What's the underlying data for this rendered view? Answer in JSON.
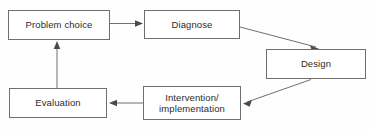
{
  "diagram": {
    "type": "cycle-flowchart",
    "background_color": "#fefefe",
    "line_color": "#6f6f6f",
    "text_color": "#2b2b2b",
    "nodes": [
      {
        "id": "problem-choice",
        "label": "Problem choice",
        "x": 8,
        "y": 10,
        "width": 102,
        "height": 30
      },
      {
        "id": "diagnose",
        "label": "Diagnose",
        "x": 144,
        "y": 10,
        "width": 96,
        "height": 29
      },
      {
        "id": "design",
        "label": "Design",
        "x": 266,
        "y": 49,
        "width": 100,
        "height": 30
      },
      {
        "id": "intervention-implementation",
        "label": "Intervention/\nimplementation",
        "x": 143,
        "y": 86,
        "width": 98,
        "height": 34
      },
      {
        "id": "evaluation",
        "label": "Evaluation",
        "x": 9,
        "y": 88,
        "width": 98,
        "height": 30
      }
    ],
    "edges": [
      {
        "id": "problem-choice-to-diagnose",
        "from": "problem-choice",
        "to": "diagnose",
        "direction": "right",
        "path": "M 110 23.5 L 140 23.5",
        "arrow_at": [
          140,
          23.5
        ],
        "arrow_angle": 0
      },
      {
        "id": "diagnose-to-design",
        "from": "diagnose",
        "to": "design",
        "direction": "down-right",
        "path": "M 240 27 L 317 47.5",
        "arrow_at": [
          317,
          47.5
        ],
        "arrow_angle": 15
      },
      {
        "id": "design-to-intervention",
        "from": "design",
        "to": "intervention-implementation",
        "direction": "down-left",
        "path": "M 311 79.5 L 245 102.5",
        "arrow_at": [
          245,
          102.5
        ],
        "arrow_angle": 199
      },
      {
        "id": "intervention-to-evaluation",
        "from": "intervention-implementation",
        "to": "evaluation",
        "direction": "left",
        "path": "M 143 103 L 110 103",
        "arrow_at": [
          110,
          103
        ],
        "arrow_angle": 180
      },
      {
        "id": "evaluation-to-problem-choice",
        "from": "evaluation",
        "to": "problem-choice",
        "direction": "up",
        "path": "M 57 88 L 57 43",
        "arrow_at": [
          57,
          43
        ],
        "arrow_angle": 270
      }
    ]
  }
}
